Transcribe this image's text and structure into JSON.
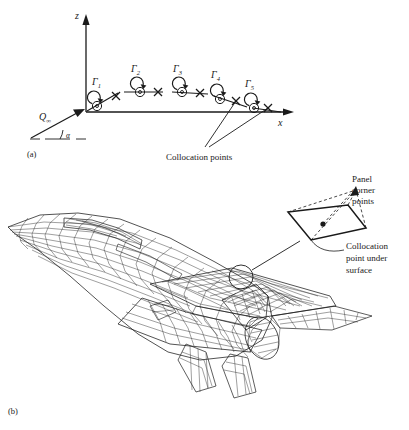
{
  "figure": {
    "title_visible": false,
    "background_color": "#ffffff",
    "ink_color": "#1a1a1a"
  },
  "panel_a": {
    "tag": "(a)",
    "axes": {
      "vertical_label": "z",
      "horizontal_label": "x"
    },
    "freestream": {
      "label": "Q",
      "subscript": "∞",
      "angle_label": "α"
    },
    "vortices": [
      {
        "label": "Γ",
        "subscript": "1"
      },
      {
        "label": "Γ",
        "subscript": "2"
      },
      {
        "label": "Γ",
        "subscript": "3"
      },
      {
        "label": "Γ",
        "subscript": "4"
      },
      {
        "label": "Γ",
        "subscript": "5"
      }
    ],
    "annotation": "Collocation points"
  },
  "panel_b": {
    "tag": "(b)",
    "subject": "wireframe-aircraft-panel-mesh",
    "callouts": {
      "corner_points": "Panel\ncorner\npoints",
      "corner_points_line1": "Panel",
      "corner_points_line2": "corner",
      "corner_points_line3": "points",
      "collocation_line1": "Collocation",
      "collocation_line2": "point under",
      "collocation_line3": "surface"
    }
  }
}
